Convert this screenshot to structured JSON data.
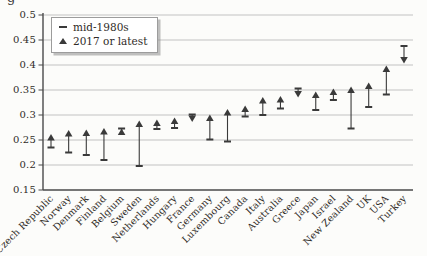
{
  "page": {
    "corner_fragment": "g",
    "background": "#fcfcfa"
  },
  "legend": {
    "items": [
      {
        "marker": "dash",
        "label": "mid-1980s"
      },
      {
        "marker": "triangle-up",
        "label": "2017 or latest"
      }
    ]
  },
  "chart_data": {
    "type": "scatter",
    "title": "",
    "xlabel": "",
    "ylabel": "",
    "ylim": [
      0.15,
      0.5
    ],
    "ytick_labels": [
      "0.5",
      "0.45",
      "0.4",
      "0.35",
      "0.3",
      "0.25",
      "0.2",
      "0.15"
    ],
    "grid": true,
    "legend_position": "top-left",
    "series_names": [
      "mid-1980s",
      "2017 or latest"
    ],
    "points": [
      {
        "country": "Czech Republic",
        "mid_1980s": 0.235,
        "latest_2017": 0.255,
        "arrow": "up"
      },
      {
        "country": "Norway",
        "mid_1980s": 0.225,
        "latest_2017": 0.263,
        "arrow": "up"
      },
      {
        "country": "Denmark",
        "mid_1980s": 0.22,
        "latest_2017": 0.264,
        "arrow": "up"
      },
      {
        "country": "Finland",
        "mid_1980s": 0.21,
        "latest_2017": 0.267,
        "arrow": "up"
      },
      {
        "country": "Belgium",
        "mid_1980s": 0.273,
        "latest_2017": 0.266,
        "arrow": "up"
      },
      {
        "country": "Sweden",
        "mid_1980s": 0.198,
        "latest_2017": 0.282,
        "arrow": "up"
      },
      {
        "country": "Netherlands",
        "mid_1980s": 0.272,
        "latest_2017": 0.284,
        "arrow": "up"
      },
      {
        "country": "Hungary",
        "mid_1980s": 0.274,
        "latest_2017": 0.288,
        "arrow": "up"
      },
      {
        "country": "France",
        "mid_1980s": 0.301,
        "latest_2017": 0.293,
        "arrow": "down"
      },
      {
        "country": "Germany",
        "mid_1980s": 0.251,
        "latest_2017": 0.294,
        "arrow": "up"
      },
      {
        "country": "Luxembourg",
        "mid_1980s": 0.247,
        "latest_2017": 0.305,
        "arrow": "up"
      },
      {
        "country": "Canada",
        "mid_1980s": 0.297,
        "latest_2017": 0.312,
        "arrow": "up"
      },
      {
        "country": "Italy",
        "mid_1980s": 0.3,
        "latest_2017": 0.329,
        "arrow": "up"
      },
      {
        "country": "Australia",
        "mid_1980s": 0.313,
        "latest_2017": 0.331,
        "arrow": "up"
      },
      {
        "country": "Greece",
        "mid_1980s": 0.353,
        "latest_2017": 0.342,
        "arrow": "down"
      },
      {
        "country": "Japan",
        "mid_1980s": 0.31,
        "latest_2017": 0.34,
        "arrow": "up"
      },
      {
        "country": "Israel",
        "mid_1980s": 0.33,
        "latest_2017": 0.346,
        "arrow": "up"
      },
      {
        "country": "New Zealand",
        "mid_1980s": 0.273,
        "latest_2017": 0.35,
        "arrow": "up"
      },
      {
        "country": "UK",
        "mid_1980s": 0.316,
        "latest_2017": 0.358,
        "arrow": "up"
      },
      {
        "country": "USA",
        "mid_1980s": 0.341,
        "latest_2017": 0.392,
        "arrow": "up"
      },
      {
        "country": "Turkey",
        "mid_1980s": 0.438,
        "latest_2017": 0.41,
        "arrow": "down"
      }
    ],
    "colors": {
      "marker": "#3a3a3a",
      "grid": "#bcbcbc",
      "axis": "#4a4a4a",
      "text": "#2f2b27",
      "legend_border": "#9c9c9c",
      "background": "#fcfcfa"
    }
  }
}
